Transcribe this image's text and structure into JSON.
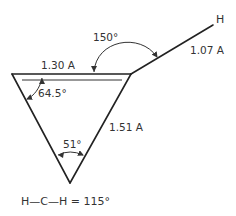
{
  "diagram": {
    "atoms": {
      "terminal_atom": "H"
    },
    "bond_lengths": {
      "top_ring_bond": "1.30 A",
      "ring_side_bond": "1.51 A",
      "c_h_bond": "1.07 A"
    },
    "angles": {
      "exocyclic_angle": "150°",
      "ring_top_left_angle": "64.5°",
      "ring_bottom_angle": "51°"
    },
    "caption": "H—C—H = 115°"
  }
}
